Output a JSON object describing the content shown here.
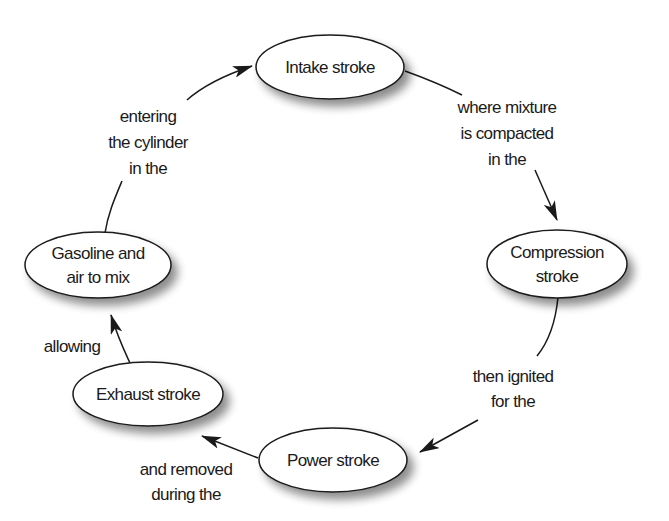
{
  "diagram": {
    "colors": {
      "stroke": "#1a1a1a",
      "fill": "#ffffff",
      "shadow": "#9a9a9a"
    },
    "nodes": [
      {
        "id": "intake",
        "lines": [
          "Intake stroke"
        ]
      },
      {
        "id": "compression",
        "lines": [
          "Compression",
          "stroke"
        ]
      },
      {
        "id": "power",
        "lines": [
          "Power stroke"
        ]
      },
      {
        "id": "exhaust",
        "lines": [
          "Exhaust stroke"
        ]
      },
      {
        "id": "gasoline",
        "lines": [
          "Gasoline and",
          "air to mix"
        ]
      }
    ],
    "edges": [
      {
        "from": "intake",
        "to": "compression",
        "lines": [
          "where mixture",
          "is compacted",
          "in the"
        ]
      },
      {
        "from": "compression",
        "to": "power",
        "lines": [
          "then ignited",
          "for the"
        ]
      },
      {
        "from": "power",
        "to": "exhaust",
        "lines": [
          "and removed",
          "during the"
        ]
      },
      {
        "from": "exhaust",
        "to": "gasoline",
        "lines": [
          "allowing"
        ]
      },
      {
        "from": "gasoline",
        "to": "intake",
        "lines": [
          "entering",
          "the cylinder",
          "in the"
        ]
      }
    ]
  }
}
